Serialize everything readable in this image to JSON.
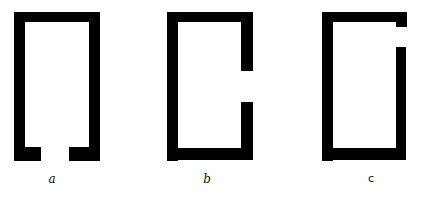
{
  "figures": [
    {
      "id": "a",
      "label": "a",
      "gap": "bottom-center"
    },
    {
      "id": "b",
      "label": "b",
      "gap": "right-middle"
    },
    {
      "id": "c",
      "label": "c",
      "gap": "right-top"
    }
  ],
  "colors": {
    "stroke": "#000000",
    "background": "#ffffff"
  }
}
